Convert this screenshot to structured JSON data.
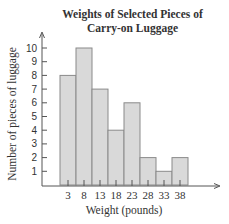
{
  "chart_data": {
    "type": "bar",
    "title": "Weights of Selected Pieces of Carry-on Luggage",
    "title_lines": [
      "Weights of Selected Pieces of",
      "Carry-on Luggage"
    ],
    "xlabel": "Weight (pounds)",
    "ylabel": "Number of pieces of luggage",
    "categories": [
      "3",
      "8",
      "13",
      "18",
      "23",
      "28",
      "33",
      "38"
    ],
    "values": [
      8,
      10,
      7,
      4,
      6,
      2,
      1,
      2
    ],
    "yticks": [
      1,
      2,
      3,
      4,
      5,
      6,
      7,
      8,
      9,
      10
    ],
    "ylim": [
      0,
      11
    ],
    "grid": false,
    "bar_color": "#d9d9d9",
    "bar_edge_color": "#8a8a8a",
    "histogram": true
  }
}
